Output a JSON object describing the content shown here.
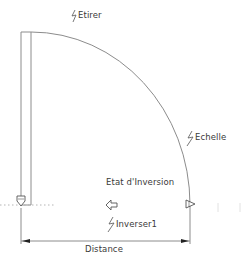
{
  "diagram": {
    "type": "dynamic-block-drawing",
    "colors": {
      "line": "#8c8c8c",
      "text": "#3a3a3a",
      "grip": "#555555",
      "dotted": "#b5b5b5",
      "arrowhead": "#222222"
    },
    "parameters": {
      "stretch": {
        "label": "Etirer",
        "icon": "lightning-action-icon"
      },
      "scale": {
        "label": "Echelle",
        "icon": "lightning-action-icon"
      },
      "flip": {
        "label": "Etat d'Inversion",
        "action_label": "Inverser1",
        "icon": "lightning-action-icon",
        "arrow": "left-arrow-grip"
      }
    },
    "dimension": {
      "label": "Distance"
    }
  }
}
